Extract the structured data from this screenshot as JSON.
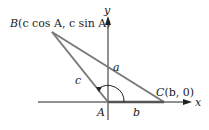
{
  "diagram": {
    "colors": {
      "triangle": "#7a7a7a",
      "side_b": "#555555",
      "axis": "#222222",
      "text": "#222222"
    },
    "axes": {
      "x_label": "x",
      "y_label": "y"
    },
    "vertices": {
      "B": {
        "name": "B",
        "coords": "(c cos A, c sin A)"
      },
      "C": {
        "name": "C",
        "coords": "(b, 0)"
      },
      "A": {
        "name": "A"
      }
    },
    "sides": {
      "a": "a",
      "b": "b",
      "c": "c"
    }
  }
}
